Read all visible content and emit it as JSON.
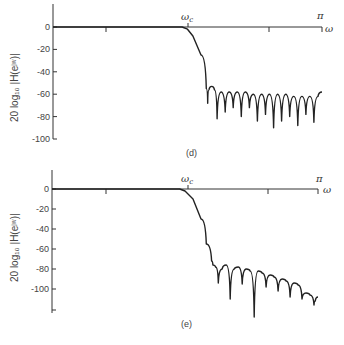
{
  "chart_data": [
    {
      "type": "line",
      "panel": "(d)",
      "title": "",
      "xlabel": "ω",
      "ylabel": "20 log10 |H(e^jω)|",
      "x_ticks": [
        {
          "label": "",
          "pos": 0
        },
        {
          "label": "ωc",
          "pos": 0.5
        },
        {
          "label": "",
          "pos": 0.8
        },
        {
          "label": "π",
          "pos": 1.0
        }
      ],
      "y_ticks": [
        0,
        -20,
        -40,
        -60,
        -80,
        -100
      ],
      "ylim": [
        -100,
        20
      ],
      "xlim": [
        0,
        1
      ],
      "x_units": "fraction of π",
      "x": [
        0.0,
        0.48,
        0.5,
        0.52,
        0.55,
        0.57,
        0.575,
        0.58,
        0.59,
        0.6,
        0.61,
        0.625,
        0.64,
        0.655,
        0.67,
        0.685,
        0.7,
        0.715,
        0.73,
        0.745,
        0.76,
        0.775,
        0.79,
        0.805,
        0.82,
        0.835,
        0.85,
        0.865,
        0.88,
        0.895,
        0.91,
        0.925,
        0.94,
        0.955,
        0.97,
        0.985,
        1.0
      ],
      "values": [
        0,
        0,
        -2,
        -8,
        -25,
        -55,
        -68,
        -56,
        -53,
        -56,
        -82,
        -58,
        -76,
        -58,
        -72,
        -58,
        -80,
        -58,
        -72,
        -60,
        -84,
        -60,
        -78,
        -60,
        -90,
        -60,
        -84,
        -60,
        -80,
        -62,
        -88,
        -62,
        -78,
        -62,
        -85,
        -62,
        -58
      ]
    },
    {
      "type": "line",
      "panel": "(e)",
      "title": "",
      "xlabel": "ω",
      "ylabel": "20 log10 |H(e^jω)|",
      "x_ticks": [
        {
          "label": "",
          "pos": 0
        },
        {
          "label": "ωc",
          "pos": 0.5
        },
        {
          "label": "",
          "pos": 0.8
        },
        {
          "label": "π",
          "pos": 1.0
        }
      ],
      "y_ticks": [
        0,
        -20,
        -40,
        -60,
        -80,
        -100
      ],
      "ylim": [
        -120,
        20
      ],
      "xlim": [
        0,
        1
      ],
      "x_units": "fraction of π",
      "x": [
        0.0,
        0.48,
        0.5,
        0.53,
        0.56,
        0.58,
        0.6,
        0.605,
        0.615,
        0.625,
        0.64,
        0.655,
        0.67,
        0.685,
        0.7,
        0.715,
        0.73,
        0.745,
        0.76,
        0.775,
        0.79,
        0.805,
        0.82,
        0.835,
        0.85,
        0.865,
        0.88,
        0.895,
        0.91,
        0.925,
        0.94,
        0.955,
        0.97,
        0.985,
        0.99,
        1.0
      ],
      "values": [
        0,
        0,
        -2,
        -10,
        -30,
        -55,
        -72,
        -76,
        -78,
        -94,
        -80,
        -76,
        -110,
        -80,
        -78,
        -95,
        -80,
        -82,
        -128,
        -82,
        -84,
        -98,
        -86,
        -88,
        -102,
        -90,
        -92,
        -108,
        -94,
        -96,
        -110,
        -104,
        -106,
        -116,
        -112,
        -108
      ]
    }
  ],
  "panels": {
    "top": {
      "label": "(d)",
      "ylabel": "20 log₁₀ |H(eʲʷ)|",
      "y_tick_labels": [
        "0",
        "-20",
        "-40",
        "-60",
        "-80",
        "-100"
      ],
      "x_cutoff_label": "ω",
      "x_cutoff_sub": "c",
      "x_end_label": "π",
      "x_axis_label": "ω"
    },
    "bottom": {
      "label": "(e)",
      "ylabel": "20 log₁₀ |H(eʲʷ)|",
      "y_tick_labels": [
        "0",
        "-20",
        "-40",
        "-60",
        "-80",
        "-100"
      ],
      "x_cutoff_label": "ω",
      "x_cutoff_sub": "c",
      "x_end_label": "π",
      "x_axis_label": "ω"
    }
  }
}
